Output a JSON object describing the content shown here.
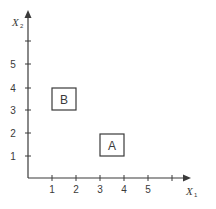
{
  "diagram": {
    "x_axis": {
      "label": "X",
      "subscript": "1",
      "ticks": [
        "1",
        "2",
        "3",
        "4",
        "5",
        ""
      ]
    },
    "y_axis": {
      "label": "X",
      "subscript": "2",
      "ticks": [
        "1",
        "2",
        "3",
        "4",
        "5",
        ""
      ]
    },
    "regions": [
      {
        "label": "B",
        "x": [
          1,
          2
        ],
        "y": [
          3,
          4
        ]
      },
      {
        "label": "A",
        "x": [
          3,
          4
        ],
        "y": [
          1,
          2
        ]
      }
    ],
    "colors": {
      "ink": "#3a3a3a",
      "background": "#ffffff"
    }
  }
}
